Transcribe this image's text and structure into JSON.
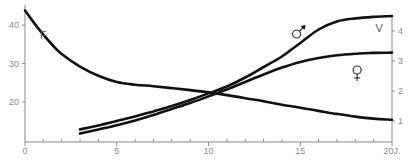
{
  "chart_data": {
    "type": "line",
    "title": "",
    "xlabel": "",
    "x_unit_label": "J.",
    "xlim": [
      0,
      20
    ],
    "x_ticks": [
      0,
      5,
      10,
      15,
      20
    ],
    "x_tick_labels": [
      "0",
      "5",
      "10",
      "15",
      "20J."
    ],
    "x_minor_ticks": [
      1,
      2,
      3,
      4,
      6,
      7,
      8,
      9,
      11,
      12,
      13,
      14,
      16,
      17,
      18,
      19
    ],
    "y_left": {
      "label": "",
      "lim": [
        10,
        44
      ],
      "ticks": [
        20,
        30,
        40
      ],
      "tick_labels": [
        "20",
        "30",
        "40"
      ]
    },
    "y_right": {
      "label": "",
      "lim": [
        0.3,
        4.8
      ],
      "ticks": [
        1,
        2,
        3,
        4
      ],
      "tick_labels": [
        "1",
        "2",
        "3",
        "4"
      ]
    },
    "grid": false,
    "series": [
      {
        "name": "F",
        "axis": "left",
        "label": "F",
        "x": [
          0,
          0.5,
          1,
          1.5,
          2,
          3,
          4,
          5,
          6,
          7,
          8,
          9,
          10,
          11,
          12,
          13,
          14,
          15,
          16,
          17,
          18,
          19,
          20
        ],
        "y": [
          43.8,
          40.5,
          37.5,
          34.8,
          32.5,
          29.2,
          26.8,
          25.2,
          24.5,
          24.1,
          23.6,
          23.1,
          22.5,
          21.8,
          21.0,
          20.2,
          19.3,
          18.5,
          17.7,
          16.9,
          16.2,
          15.7,
          15.4
        ]
      },
      {
        "name": "male",
        "axis": "right",
        "label": "♂",
        "x": [
          3,
          4,
          5,
          6,
          7,
          8,
          9,
          10,
          11,
          12,
          13,
          14,
          15,
          16,
          17,
          18,
          19,
          20
        ],
        "y": [
          0.72,
          0.85,
          1.0,
          1.15,
          1.32,
          1.5,
          1.7,
          1.92,
          2.15,
          2.45,
          2.8,
          3.15,
          3.6,
          4.05,
          4.32,
          4.42,
          4.47,
          4.5
        ]
      },
      {
        "name": "female",
        "axis": "right",
        "label": "♀",
        "x": [
          3,
          4,
          5,
          6,
          7,
          8,
          9,
          10,
          11,
          12,
          13,
          14,
          15,
          16,
          17,
          18,
          19,
          20
        ],
        "y": [
          0.58,
          0.72,
          0.86,
          1.02,
          1.2,
          1.4,
          1.6,
          1.82,
          2.05,
          2.3,
          2.55,
          2.78,
          2.97,
          3.1,
          3.19,
          3.24,
          3.27,
          3.28
        ]
      }
    ],
    "annotations": [
      {
        "text": "F",
        "x": 1.0,
        "y_left": 37.5,
        "target": "F"
      },
      {
        "text": "V",
        "x": 19.3,
        "y_right": 4.1,
        "target": "V"
      },
      {
        "text": "♂",
        "x": 14.8,
        "y_right": 3.9,
        "target": "male"
      },
      {
        "text": "♀",
        "x": 18.1,
        "y_right": 2.7,
        "target": "female"
      }
    ]
  }
}
